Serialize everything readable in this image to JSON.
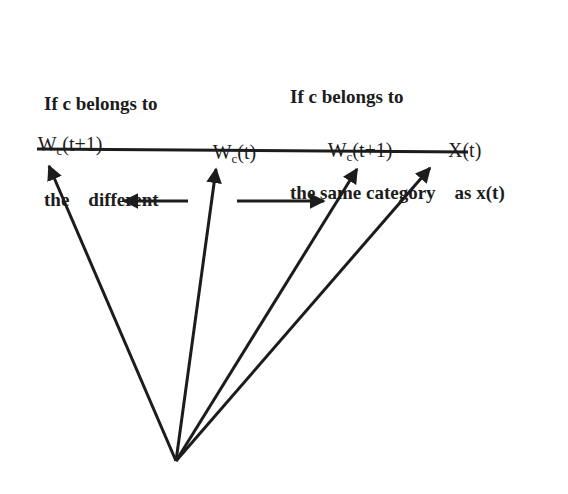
{
  "captions": {
    "different": {
      "line1": "If c belongs to",
      "line2": "the    different"
    },
    "same": {
      "line1": "If c belongs to",
      "line2": "the same category    as x(t)"
    }
  },
  "vectors": [
    {
      "id": "wc_t1_left",
      "base": "W",
      "sub": "c",
      "rest": "(t+1)",
      "tip": [
        45,
        158
      ]
    },
    {
      "id": "wc_t",
      "base": "W",
      "sub": "c",
      "rest": "(t)",
      "tip": [
        217,
        161
      ]
    },
    {
      "id": "wc_t1_right",
      "base": "W",
      "sub": "c",
      "rest": "(t+1)",
      "tip": [
        361,
        162
      ]
    },
    {
      "id": "x_t",
      "base": "X",
      "sub": "",
      "rest": "(t)",
      "tip": [
        435,
        162
      ]
    }
  ],
  "origin": [
    176,
    461
  ],
  "baseline": {
    "x1": 37,
    "y1": 149,
    "x2": 468,
    "y2": 152
  },
  "move_arrows": {
    "away": {
      "from": [
        188,
        201
      ],
      "to": [
        118,
        201
      ]
    },
    "toward": {
      "from": [
        237,
        201
      ],
      "to": [
        330,
        201
      ]
    }
  },
  "colors": {
    "ink": "#1c1c1c",
    "background": "#ffffff"
  }
}
